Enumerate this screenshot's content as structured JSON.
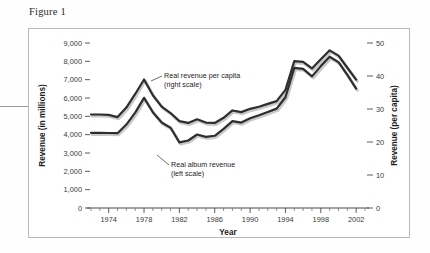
{
  "figure": {
    "title": "Figure 1"
  },
  "chart_data": {
    "type": "line",
    "title": "Figure 1",
    "xlabel": "Year",
    "ylabel": "Revenue (in millions)",
    "y2label": "Revenue (per capita)",
    "xlim": [
      1972,
      2003
    ],
    "ylim": [
      0,
      9000
    ],
    "y2lim": [
      0,
      50
    ],
    "grid": false,
    "legend_position": "inline-annotations",
    "x_tick_labels": [
      "1974",
      "1978",
      "1982",
      "1986",
      "1990",
      "1994",
      "1998",
      "2002"
    ],
    "x_tick_values": [
      1974,
      1978,
      1982,
      1986,
      1990,
      1994,
      1998,
      2002
    ],
    "x_minor_ticks": [
      1972,
      1973,
      1975,
      1976,
      1977,
      1979,
      1980,
      1981,
      1983,
      1984,
      1985,
      1987,
      1988,
      1989,
      1991,
      1992,
      1993,
      1995,
      1996,
      1997,
      1999,
      2000,
      2001,
      2003
    ],
    "y_tick_labels": [
      "0",
      "1,000",
      "2,000",
      "3,000",
      "4,000",
      "5,000",
      "6,000",
      "7,000",
      "8,000",
      "9,000"
    ],
    "y_tick_values": [
      0,
      1000,
      2000,
      3000,
      4000,
      5000,
      6000,
      7000,
      8000,
      9000
    ],
    "y2_tick_labels": [
      "0",
      "10",
      "20",
      "30",
      "40",
      "50"
    ],
    "y2_tick_values": [
      0,
      10,
      20,
      30,
      40,
      50
    ],
    "x": [
      1972,
      1973,
      1974,
      1975,
      1976,
      1977,
      1978,
      1979,
      1980,
      1981,
      1982,
      1983,
      1984,
      1985,
      1986,
      1987,
      1988,
      1989,
      1990,
      1991,
      1992,
      1993,
      1994,
      1995,
      1996,
      1997,
      1998,
      1999,
      2000,
      2001,
      2002
    ],
    "series": [
      {
        "name": "Real revenue per capita (right scale)",
        "axis": "right",
        "annotation": "Real revenue per capita",
        "annotation_sub": "(right scale)",
        "units": "per capita",
        "values": [
          28.4,
          28.4,
          28.3,
          27.6,
          30.5,
          34.6,
          39.0,
          34.2,
          30.8,
          28.8,
          26.4,
          25.8,
          26.9,
          25.9,
          25.8,
          27.4,
          29.6,
          29.1,
          30.1,
          30.7,
          31.6,
          32.4,
          35.8,
          44.5,
          44.3,
          42.3,
          45.1,
          47.8,
          46.2,
          42.5,
          38.9
        ],
        "values_left_scale_equivalent": [
          5100,
          5100,
          5080,
          4960,
          5480,
          6220,
          7010,
          6150,
          5530,
          5180,
          4740,
          4640,
          4840,
          4660,
          4640,
          4920,
          5320,
          5230,
          5410,
          5520,
          5680,
          5830,
          6440,
          8010,
          7970,
          7610,
          8110,
          8600,
          8310,
          7650,
          7000
        ]
      },
      {
        "name": "Real album revenue (left scale)",
        "axis": "left",
        "annotation": "Real album revenue",
        "annotation_sub": "(left scale)",
        "units": "millions",
        "values": [
          4100,
          4100,
          4090,
          4080,
          4550,
          5200,
          6010,
          5220,
          4660,
          4380,
          3580,
          3680,
          4010,
          3880,
          3940,
          4320,
          4740,
          4660,
          4900,
          5060,
          5240,
          5420,
          6040,
          7640,
          7590,
          7180,
          7740,
          8250,
          7960,
          7260,
          6510
        ]
      }
    ],
    "annotations": [
      {
        "text": "Real revenue per capita",
        "sub_text": "(right scale)",
        "points_to_year": 1978
      },
      {
        "text": "Real album revenue",
        "sub_text": "(left scale)",
        "points_to_year": 1983
      }
    ],
    "colors": {
      "line": "#2e2e2e",
      "line_shadow": "#c9c9c9",
      "axis": "#4a4a4a",
      "frame": "#b9b9b9",
      "text": "#1d1d1d"
    }
  }
}
